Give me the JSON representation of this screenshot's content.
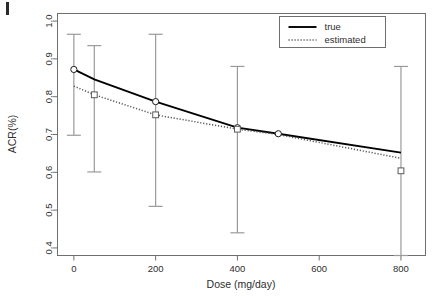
{
  "chart_data": {
    "type": "line",
    "title": "",
    "xlabel": "Dose (mg/day)",
    "ylabel": "ACR(%)",
    "xlim": [
      -40,
      860
    ],
    "ylim": [
      0.38,
      1.02
    ],
    "xticks": [
      0,
      200,
      400,
      600,
      800
    ],
    "xtick_labels": [
      "0",
      "200",
      "400",
      "600",
      "800"
    ],
    "yticks": [
      0.4,
      0.5,
      0.6,
      0.7,
      0.8,
      0.9,
      1.0
    ],
    "ytick_labels": [
      "0.4",
      "0.5",
      "0.6",
      "0.7",
      "0.8",
      "0.9",
      "1.0"
    ],
    "grid": false,
    "legend_position": "top-right",
    "series": [
      {
        "name": "true",
        "style": "solid",
        "color": "#000000",
        "x": [
          0,
          50,
          200,
          400,
          500,
          800
        ],
        "y": [
          0.872,
          0.846,
          0.787,
          0.718,
          0.702,
          0.652
        ]
      },
      {
        "name": "estimated",
        "style": "dotted",
        "color": "#555555",
        "x": [
          0,
          50,
          200,
          400,
          500,
          800
        ],
        "y": [
          0.828,
          0.805,
          0.752,
          0.714,
          0.7,
          0.637
        ]
      }
    ],
    "markers": [
      {
        "series": "true",
        "shape": "circle",
        "x": 0,
        "y": 0.872
      },
      {
        "series": "true",
        "shape": "circle",
        "x": 200,
        "y": 0.787
      },
      {
        "series": "true",
        "shape": "circle",
        "x": 400,
        "y": 0.718
      },
      {
        "series": "true",
        "shape": "circle",
        "x": 500,
        "y": 0.702
      },
      {
        "series": "estimated",
        "shape": "square",
        "x": 50,
        "y": 0.805
      },
      {
        "series": "estimated",
        "shape": "square",
        "x": 200,
        "y": 0.752
      },
      {
        "series": "estimated",
        "shape": "square",
        "x": 400,
        "y": 0.714
      },
      {
        "series": "estimated",
        "shape": "square",
        "x": 800,
        "y": 0.604
      }
    ],
    "error_bars": [
      {
        "x": 0,
        "center": 0.872,
        "lower": 0.698,
        "upper": 0.965
      },
      {
        "x": 50,
        "center": 0.805,
        "lower": 0.601,
        "upper": 0.935
      },
      {
        "x": 200,
        "center": 0.752,
        "lower": 0.51,
        "upper": 0.965
      },
      {
        "x": 400,
        "center": 0.714,
        "lower": 0.44,
        "upper": 0.88
      },
      {
        "x": 800,
        "center": 0.604,
        "lower": 0.38,
        "upper": 0.88
      }
    ],
    "legend": [
      {
        "label": "true",
        "style": "solid"
      },
      {
        "label": "estimated",
        "style": "dotted"
      }
    ]
  }
}
